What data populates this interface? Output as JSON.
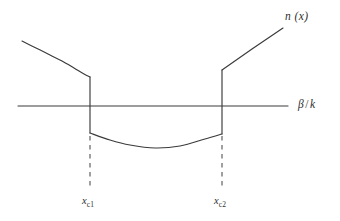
{
  "figure": {
    "kind": "line-diagram",
    "background_color": "#ffffff",
    "ink_color": "#333333",
    "labels": {
      "curve_label": "n (x)",
      "axis_label_beta": "β",
      "axis_label_slash": "/",
      "axis_label_k": "k",
      "xc1_base": "x",
      "xc1_sub": "c1",
      "xc2_base": "x",
      "xc2_sub": "c2"
    }
  },
  "chart_data": {
    "type": "line",
    "title": "",
    "subtitle": "",
    "xlabel": "β / k",
    "ylabel": "n (x)",
    "grid": false,
    "legend": null,
    "axis": {
      "horizontal_axis_y": 106,
      "horizontal_axis_x_start": 18,
      "horizontal_axis_x_end": 288,
      "vertical_axis": false
    },
    "xlim": [
      0,
      340
    ],
    "ylim": [
      221,
      0
    ],
    "annotations": [
      {
        "text": "n (x)",
        "x": 285,
        "y": 18
      },
      {
        "text": "β / k",
        "x": 298,
        "y": 106
      },
      {
        "text": "x_c1",
        "x": 90,
        "y": 202
      },
      {
        "text": "x_c2",
        "x": 222,
        "y": 202
      }
    ],
    "critical_points": [
      {
        "name": "x_c1",
        "x_px": 90,
        "label": "x",
        "subscript": "c1"
      },
      {
        "name": "x_c2",
        "x_px": 222,
        "label": "x",
        "subscript": "c2"
      }
    ],
    "series": [
      {
        "name": "n(x) left branch",
        "type": "curve",
        "points": [
          [
            22,
            41
          ],
          [
            36,
            48
          ],
          [
            50,
            55
          ],
          [
            62,
            61
          ],
          [
            74,
            68
          ],
          [
            84,
            74
          ],
          [
            90,
            77
          ]
        ]
      },
      {
        "name": "n(x) left discontinuity",
        "type": "vertical-jump",
        "points": [
          [
            90,
            77
          ],
          [
            90,
            133
          ]
        ]
      },
      {
        "name": "n(x) bottom well",
        "type": "curve",
        "points": [
          [
            90,
            133
          ],
          [
            110,
            140
          ],
          [
            130,
            145
          ],
          [
            155,
            148
          ],
          [
            180,
            146
          ],
          [
            205,
            139
          ],
          [
            222,
            134
          ]
        ]
      },
      {
        "name": "n(x) right discontinuity",
        "type": "vertical-jump",
        "points": [
          [
            222,
            134
          ],
          [
            222,
            70
          ]
        ]
      },
      {
        "name": "n(x) right branch",
        "type": "line",
        "points": [
          [
            222,
            70
          ],
          [
            252,
            49
          ],
          [
            283,
            28
          ]
        ]
      }
    ],
    "dashed_guides": [
      {
        "name": "x_c1 guide",
        "x": 90,
        "y_start": 136,
        "y_end": 190
      },
      {
        "name": "x_c2 guide",
        "x": 222,
        "y_start": 136,
        "y_end": 190
      }
    ]
  }
}
